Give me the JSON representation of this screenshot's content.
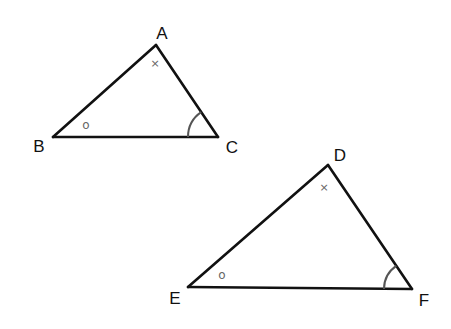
{
  "diagram": {
    "triangles": [
      {
        "name": "ABC",
        "vertices": [
          {
            "label": "A",
            "angle_mark": "×"
          },
          {
            "label": "B",
            "angle_mark": "o"
          },
          {
            "label": "C",
            "angle_mark": "arc"
          }
        ]
      },
      {
        "name": "DEF",
        "vertices": [
          {
            "label": "D",
            "angle_mark": "×"
          },
          {
            "label": "E",
            "angle_mark": "o"
          },
          {
            "label": "F",
            "angle_mark": "arc"
          }
        ]
      }
    ],
    "correspondences": [
      {
        "pair": [
          "A",
          "D"
        ],
        "mark": "×"
      },
      {
        "pair": [
          "B",
          "E"
        ],
        "mark": "o"
      },
      {
        "pair": [
          "C",
          "F"
        ],
        "mark": "arc"
      }
    ],
    "colors": {
      "line": "#111111",
      "mark": "#666666",
      "arc": "#555555",
      "background": "#ffffff"
    }
  }
}
